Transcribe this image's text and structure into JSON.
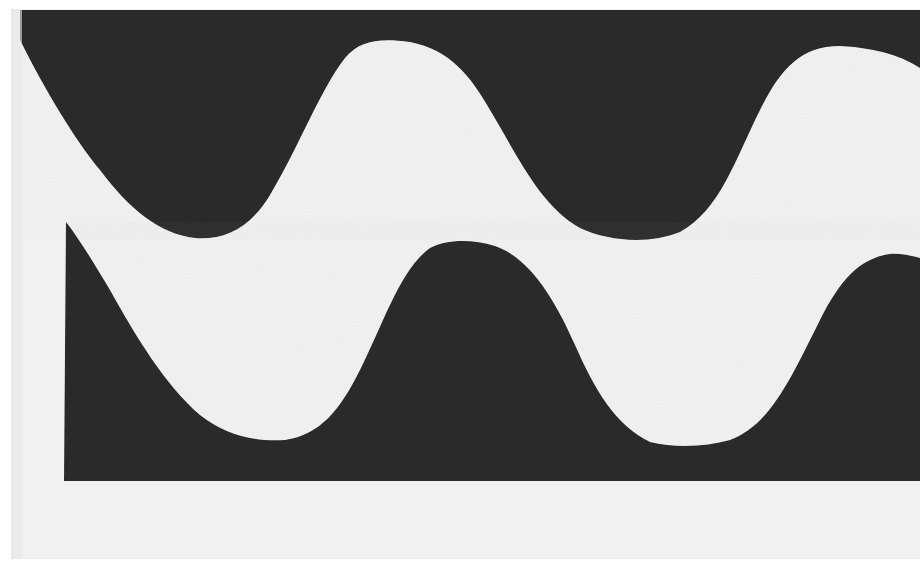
{
  "image": {
    "description": "Photograph of black cut-paper wave shapes on off-white paper",
    "colors": {
      "paper": "#f1f1ef",
      "paper_shadow": "#e4e4e2",
      "ink": "#2a2a2a",
      "page_edge": "#ffffff"
    },
    "shapes": [
      {
        "name": "upper-wave",
        "fill": "#2a2a2a"
      },
      {
        "name": "lower-wave",
        "fill": "#2a2a2a"
      }
    ]
  }
}
